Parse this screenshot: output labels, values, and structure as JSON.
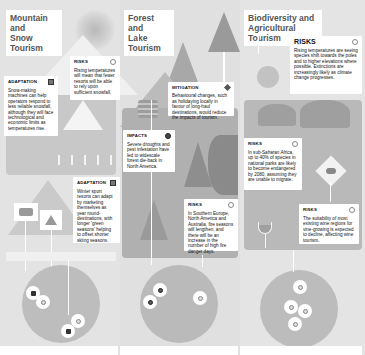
{
  "columns": [
    {
      "title": "Mountain and Snow Tourism",
      "title_lines": [
        "Mountain and",
        "Snow Tourism"
      ],
      "cards": [
        {
          "heading": "RISKS",
          "icon": "risk-icon",
          "text": "Rising temperatures will mean that fewer resorts will be able to rely upon sufficient snowfall."
        },
        {
          "heading": "ADAPTATION",
          "icon": "adaptation-icon",
          "text": "Snow-making machines can help operators respond to less reliable snowfall, although they will face technological and economic limits as temperatures rise."
        },
        {
          "heading": "ADAPTATION",
          "icon": "adaptation-icon",
          "text": "Winter sport resorts can adapt by marketing themselves as year round-destinations, with longer 'green seasons' helping to offset shorter skiing seasons."
        }
      ]
    },
    {
      "title": "Forest and Lake Tourism",
      "title_lines": [
        "Forest and",
        "Lake Tourism"
      ],
      "cards": [
        {
          "heading": "MITIGATION",
          "icon": "mitigation-icon",
          "text": "Behavioural changes, such as holidaying locally in favour of long-haul destinations, would reduce the impacts of tourism."
        },
        {
          "heading": "IMPACTS",
          "icon": "impact-icon",
          "text": "Severe droughts and pest infestation have led to widescale forest die-back in North America."
        },
        {
          "heading": "RISKS",
          "icon": "risk-icon",
          "text": "In Southern Europe, North America and Australia, fire seasons will lengthen, and there will be an increase in the number of high fire danger days."
        }
      ]
    },
    {
      "title": "Biodiversity and Agricultural Tourism",
      "title_lines": [
        "Biodiversity and",
        "Agricultural Tourism"
      ],
      "cards": [
        {
          "heading": "RISKS",
          "icon": "risk-icon",
          "text": "Rising temperatures are seeing species shift towards the poles and to higher elevations where possible. Extinctions are increasingly likely as climate change progresses."
        },
        {
          "heading": "RISKS",
          "icon": "risk-icon",
          "text": "In sub-Saharan Africa, up to 40% of species in national parks are likely to become endangered by 2080, assuming they are unable to migrate."
        },
        {
          "heading": "RISKS",
          "icon": "risk-icon",
          "text": "The suitability of most existing wine regions for vine-growing is expected to decline, affecting wine tourism."
        }
      ]
    }
  ],
  "colors": {
    "background": "#e6e6e6",
    "panel_dark": "#bdbdbd",
    "panel_mid": "#cfcfcf",
    "globe": "#b9b9b9",
    "card": "#ffffff",
    "title_text": "#555555"
  }
}
